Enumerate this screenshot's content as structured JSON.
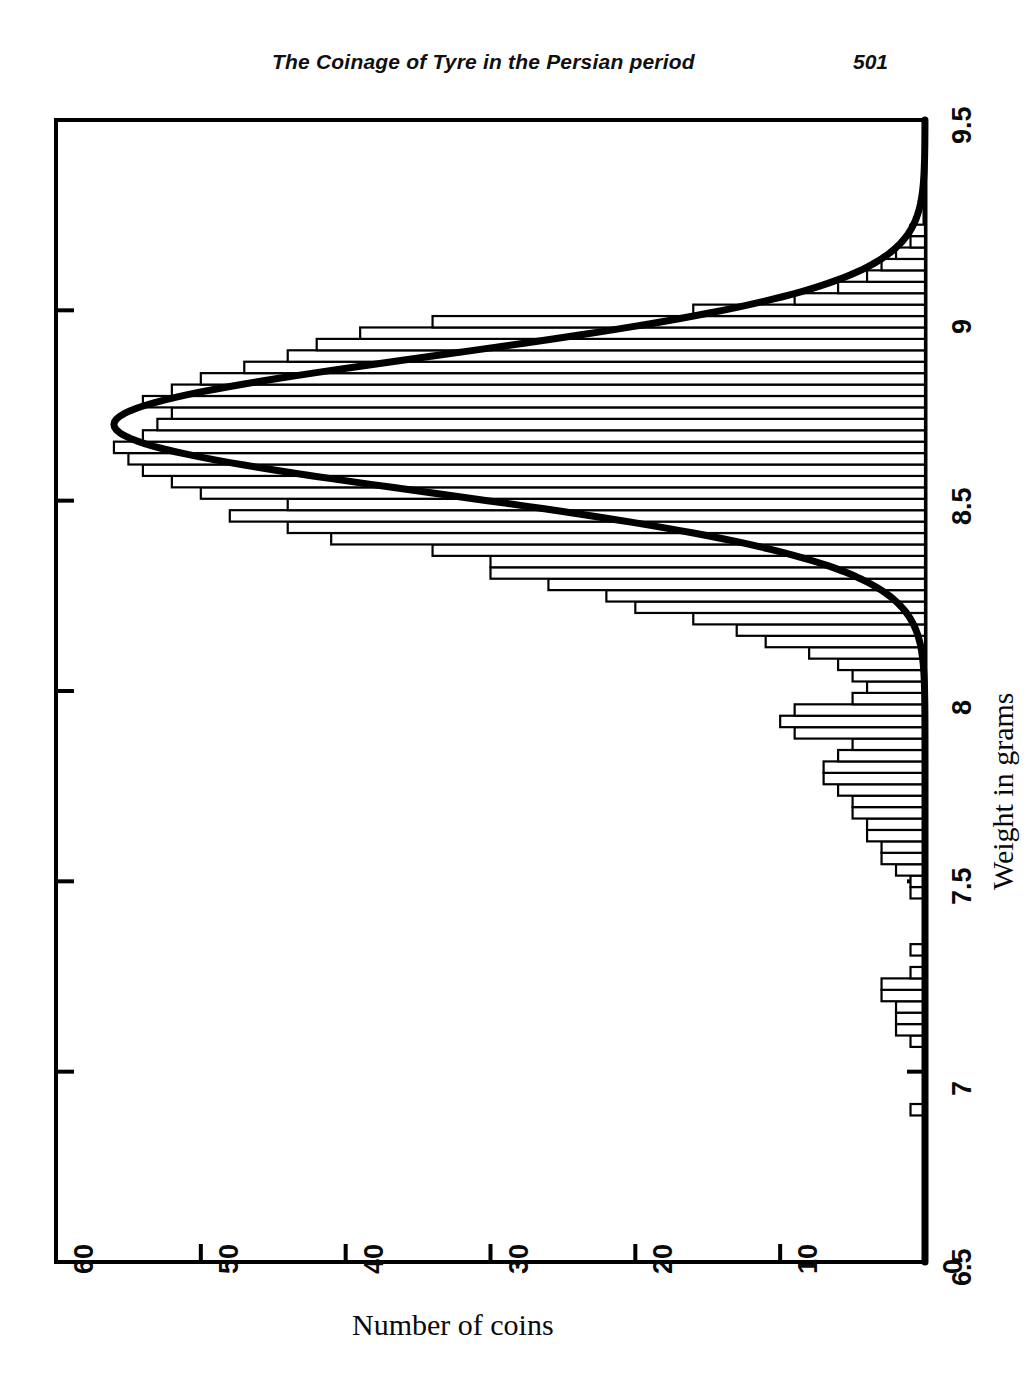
{
  "page": {
    "running_head": "The Coinage of Tyre in the Persian period",
    "page_number": "501"
  },
  "chart_data": {
    "type": "bar",
    "orientation": "horizontal",
    "title": "",
    "subtitle": "",
    "xlabel": "Number of coins",
    "ylabel": "Weight in grams",
    "value_axis_label": "Number of coins",
    "category_axis_label": "Weight in grams",
    "xlim": [
      0,
      60
    ],
    "ylim": [
      6.5,
      9.5
    ],
    "x_ticks": [
      60,
      50,
      40,
      30,
      20,
      10,
      0
    ],
    "x_tick_labels": [
      "60",
      "50",
      "40",
      "30",
      "20",
      "10",
      "0"
    ],
    "x_axis_reversed": true,
    "y_ticks": [
      9.5,
      9,
      8.5,
      8,
      7.5,
      7,
      6.5
    ],
    "y_tick_labels": [
      "9.5",
      "9",
      "8.5",
      "8",
      "7.5",
      "7",
      "6.5"
    ],
    "grid": false,
    "legend": false,
    "bin_width": 0.03,
    "categories": [
      6.9,
      6.93,
      6.96,
      6.99,
      7.02,
      7.05,
      7.08,
      7.11,
      7.14,
      7.17,
      7.2,
      7.23,
      7.26,
      7.29,
      7.32,
      7.35,
      7.38,
      7.41,
      7.44,
      7.47,
      7.5,
      7.53,
      7.56,
      7.59,
      7.62,
      7.65,
      7.68,
      7.71,
      7.74,
      7.77,
      7.8,
      7.83,
      7.86,
      7.89,
      7.92,
      7.95,
      7.98,
      8.01,
      8.04,
      8.07,
      8.1,
      8.13,
      8.16,
      8.19,
      8.22,
      8.25,
      8.28,
      8.31,
      8.34,
      8.37,
      8.4,
      8.43,
      8.46,
      8.49,
      8.52,
      8.55,
      8.58,
      8.61,
      8.64,
      8.67,
      8.7,
      8.73,
      8.76,
      8.79,
      8.82,
      8.85,
      8.88,
      8.91,
      8.94,
      8.97,
      9.0,
      9.03,
      9.06,
      9.09,
      9.12,
      9.15,
      9.18,
      9.21
    ],
    "values": [
      1,
      0,
      0,
      0,
      0,
      0,
      1,
      2,
      2,
      2,
      3,
      3,
      1,
      0,
      1,
      0,
      0,
      0,
      0,
      1,
      1,
      2,
      3,
      3,
      4,
      4,
      5,
      5,
      6,
      7,
      7,
      6,
      5,
      9,
      10,
      9,
      5,
      4,
      5,
      6,
      8,
      11,
      13,
      16,
      20,
      22,
      26,
      30,
      30,
      34,
      41,
      44,
      48,
      44,
      50,
      52,
      54,
      55,
      56,
      54,
      53,
      52,
      54,
      52,
      50,
      47,
      44,
      42,
      39,
      34,
      16,
      9,
      6,
      4,
      3,
      2,
      1,
      1
    ],
    "fit_curve": {
      "type": "normal",
      "mean": 8.7,
      "sigma": 0.18,
      "peak_value": 56,
      "description": "fitted normal distribution overlay"
    },
    "max_value": 56,
    "mode_weight": 8.64
  }
}
